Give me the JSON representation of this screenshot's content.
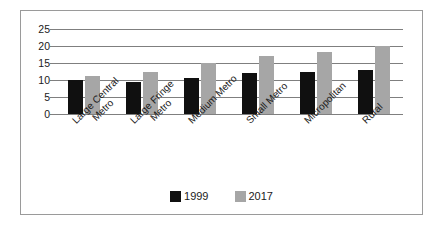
{
  "chart_data": {
    "type": "bar",
    "title": "",
    "subtitle": "",
    "xlabel": "",
    "ylabel": "",
    "ylim": [
      0,
      25
    ],
    "ytick_labels": [
      "0",
      "5",
      "10",
      "15",
      "20",
      "25"
    ],
    "ytick_values": [
      0,
      5,
      10,
      15,
      20,
      25
    ],
    "grid": true,
    "legend_position": "bottom",
    "categories": [
      "Large Central Metro",
      "Large Fringe Metro",
      "Medium Metro",
      "Small Metro",
      "Micropolitan",
      "Rural"
    ],
    "category_lines": [
      [
        "Large Central",
        "Metro"
      ],
      [
        "Large Fringe",
        "Metro"
      ],
      [
        "Medium Metro"
      ],
      [
        "Small Metro"
      ],
      [
        "Micropolitan"
      ],
      [
        "Rural"
      ]
    ],
    "series": [
      {
        "name": "1999",
        "color": "#101010",
        "values": [
          10.0,
          9.5,
          10.7,
          12.1,
          12.3,
          13.0
        ]
      },
      {
        "name": "2017",
        "color": "#a6a6a6",
        "values": [
          11.2,
          12.5,
          15.1,
          17.0,
          18.3,
          20.1
        ]
      }
    ]
  },
  "legend": {
    "items": [
      {
        "label": "1999",
        "color": "#101010"
      },
      {
        "label": "2017",
        "color": "#a6a6a6"
      }
    ]
  },
  "colors": {
    "series_1999": "#101010",
    "series_2017": "#a6a6a6",
    "gridline": "#7f7f7f",
    "frame_border": "#9a9a9a",
    "background": "#ffffff",
    "text": "#1a1a1a"
  }
}
